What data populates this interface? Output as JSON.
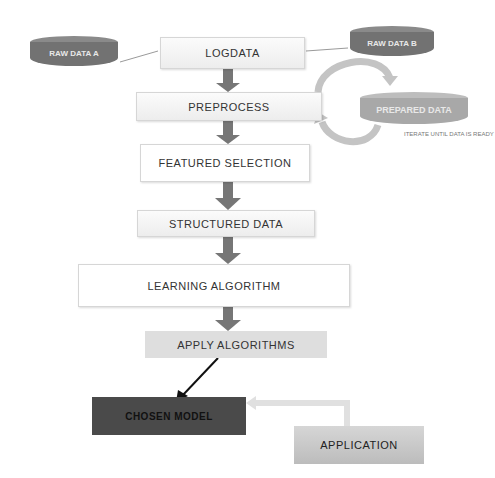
{
  "nodes": {
    "raw_data_a": "RAW DATA A",
    "raw_data_b": "RAW DATA B",
    "logdata": "LOGDATA",
    "preprocess": "PREPROCESS",
    "prepared_data": "PREPARED DATA",
    "iterate_note": "ITERATE UNTIL DATA IS READY",
    "featured_selection": "FEATURED SELECTION",
    "structured_data": "STRUCTURED DATA",
    "learning_algorithm": "LEARNING ALGORITHM",
    "apply_algorithms": "APPLY ALGORITHMS",
    "chosen_model": "CHOSEN MODEL",
    "application": "APPLICATION"
  },
  "colors": {
    "arrow": "#767676",
    "cylinder": "#727272",
    "prepared_cylinder": "#a8a8a8",
    "chosen_model": "#4a4a4a",
    "application": "#c8c8c8",
    "apply_algorithms": "#dedede"
  }
}
